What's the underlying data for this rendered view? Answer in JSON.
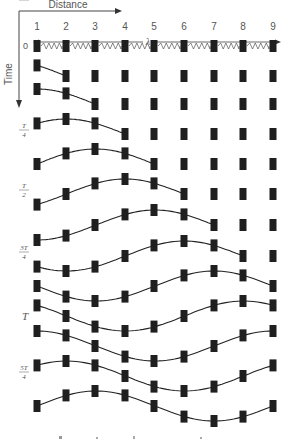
{
  "axes": {
    "distance_label": "Distance",
    "time_label": "Time",
    "wavelength_symbol": "λ"
  },
  "columns": [
    "1",
    "2",
    "3",
    "4",
    "5",
    "6",
    "7",
    "8",
    "9"
  ],
  "initial_row_label": "0",
  "time_labels": [
    {
      "row": 3,
      "num": "T",
      "den": "4"
    },
    {
      "row": 5,
      "num": "T",
      "den": "2"
    },
    {
      "row": 7,
      "num": "3T",
      "den": "4"
    },
    {
      "row": 9,
      "label": "T"
    },
    {
      "row": 11,
      "num": "5T",
      "den": "4"
    },
    {
      "row": 13,
      "num": "3T",
      "den": "2"
    }
  ],
  "wave": {
    "time_step_fraction_of_period": 0.125,
    "masses_per_wavelength": 8,
    "rows": 13,
    "colors": {
      "mass": "#1f1f1f",
      "line": "#222222",
      "text": "#555555"
    }
  },
  "caption_partial": "(caption text cut off at bottom edge)"
}
